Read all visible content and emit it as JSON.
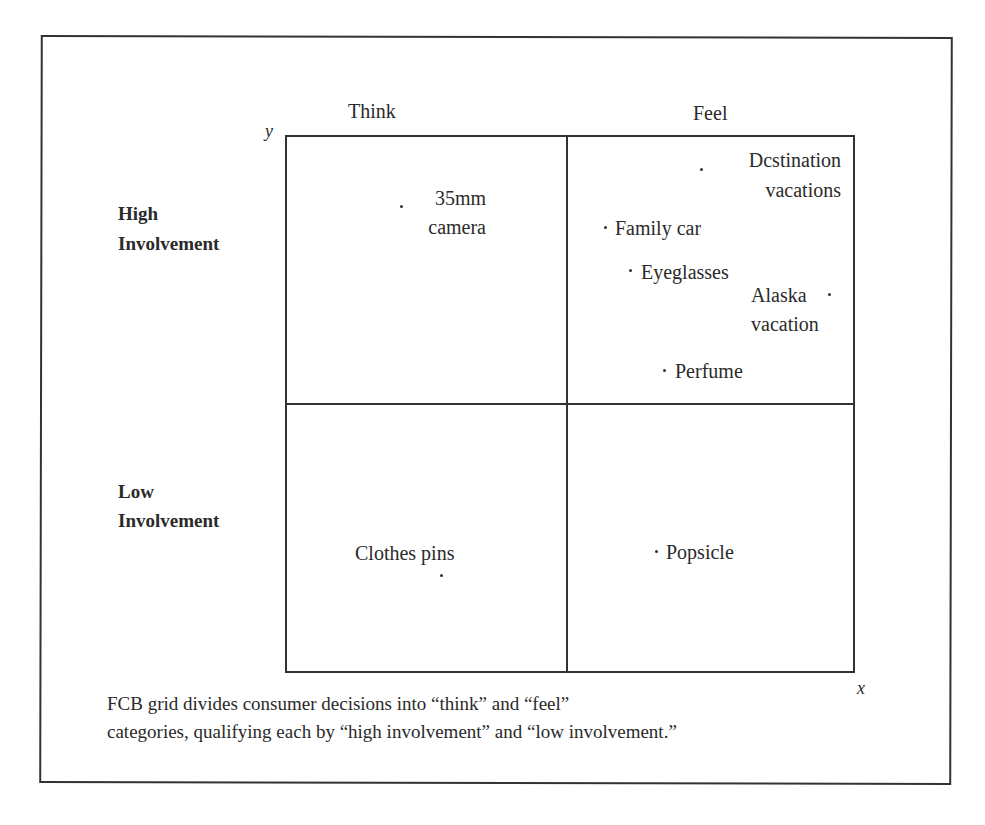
{
  "diagram": {
    "columns": {
      "think": "Think",
      "feel": "Feel"
    },
    "axes": {
      "y": "y",
      "x": "x"
    },
    "rows": {
      "high": [
        "High",
        "Involvement"
      ],
      "low": [
        "Low",
        "Involvement"
      ]
    },
    "items": {
      "camera": [
        "35mm",
        "camera"
      ],
      "destination": [
        "Dcstination",
        "vacations"
      ],
      "family_car": "Family car",
      "eyeglasses": "Eyeglasses",
      "alaska": [
        "Alaska",
        "vacation"
      ],
      "perfume": "Perfume",
      "clothes_pins": "Clothes pins",
      "popsicle": "Popsicle"
    },
    "caption": [
      "FCB grid divides consumer decisions into “think” and “feel”",
      "categories, qualifying each by “high involvement” and “low involvement.”"
    ]
  }
}
